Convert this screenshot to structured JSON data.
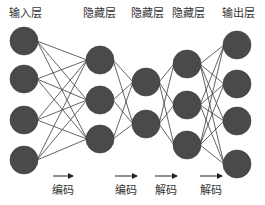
{
  "diagram": {
    "type": "autoencoder-neural-network",
    "colors": {
      "node_fill": "#4a4a4a",
      "node_stroke": "#3a3a3a",
      "edge": "#3c3c3c",
      "text": "#333333",
      "background": "#ffffff"
    },
    "node_radius": 14,
    "layers": [
      {
        "label": "输入层",
        "x": 24,
        "label_x": 25,
        "nodes_y": [
          41,
          79,
          120,
          160
        ]
      },
      {
        "label": "隐藏层",
        "x": 100,
        "label_x": 99,
        "nodes_y": [
          60,
          100,
          139
        ]
      },
      {
        "label": "隐藏层",
        "x": 146,
        "label_x": 147,
        "nodes_y": [
          82,
          124
        ]
      },
      {
        "label": "隐藏层",
        "x": 187,
        "label_x": 188,
        "nodes_y": [
          64,
          105,
          145
        ]
      },
      {
        "label": "输出层",
        "x": 237,
        "label_x": 238,
        "nodes_y": [
          45,
          84,
          121,
          164
        ]
      }
    ],
    "stages": [
      {
        "label": "编码",
        "arrow_x1": 53,
        "arrow_x2": 73,
        "label_x": 63
      },
      {
        "label": "编码",
        "arrow_x1": 115,
        "arrow_x2": 137,
        "label_x": 126
      },
      {
        "label": "解码",
        "arrow_x1": 155,
        "arrow_x2": 177,
        "label_x": 166
      },
      {
        "label": "解码",
        "arrow_x1": 200,
        "arrow_x2": 222,
        "label_x": 211
      }
    ],
    "arrow_y": 176
  }
}
